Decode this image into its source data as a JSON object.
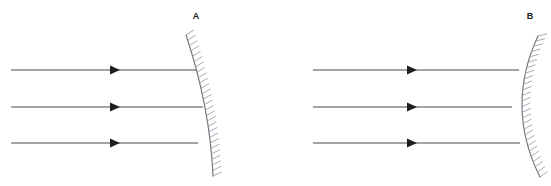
{
  "figure": {
    "width": 551,
    "height": 186,
    "background": "#ffffff",
    "clipped_caption_text": "",
    "colors": {
      "ray": "#4a4a4a",
      "arrowhead": "#1e1e1e",
      "mirror_curve": "#6e6e78",
      "mirror_hatch": "#9a9aa4",
      "label": "#1a1a1a"
    }
  },
  "panels": [
    {
      "id": "panel-a",
      "label": "A",
      "label_x": 196,
      "label_y": 19,
      "mirror": {
        "type": "concave",
        "orientation": "opens-left",
        "vertex_x": 203,
        "vertex_y": 107,
        "top_x": 186,
        "top_y": 35,
        "bottom_x": 213,
        "bottom_y": 176,
        "hatch_side": "right",
        "hatch_count": 26,
        "hatch_length": 9
      },
      "rays": [
        {
          "label": "ray-top",
          "x1": 11,
          "y1": 70,
          "x2": 196,
          "y2": 70,
          "arrow_x": 116
        },
        {
          "label": "ray-middle",
          "x1": 11,
          "y1": 107,
          "x2": 203,
          "y2": 107,
          "arrow_x": 116
        },
        {
          "label": "ray-bottom",
          "x1": 11,
          "y1": 143,
          "x2": 198,
          "y2": 143,
          "arrow_x": 116
        }
      ]
    },
    {
      "id": "panel-b",
      "label": "B",
      "label_x": 530,
      "label_y": 19,
      "mirror": {
        "type": "convex",
        "orientation": "opens-right",
        "vertex_x": 512,
        "vertex_y": 107,
        "top_x": 538,
        "top_y": 36,
        "bottom_x": 540,
        "bottom_y": 177,
        "hatch_side": "right",
        "hatch_count": 26,
        "hatch_length": 9
      },
      "rays": [
        {
          "label": "ray-top",
          "x1": 313,
          "y1": 70,
          "x2": 519,
          "y2": 70,
          "arrow_x": 413
        },
        {
          "label": "ray-middle",
          "x1": 313,
          "y1": 107,
          "x2": 512,
          "y2": 107,
          "arrow_x": 413
        },
        {
          "label": "ray-bottom",
          "x1": 313,
          "y1": 143,
          "x2": 520,
          "y2": 143,
          "arrow_x": 413
        }
      ]
    }
  ]
}
